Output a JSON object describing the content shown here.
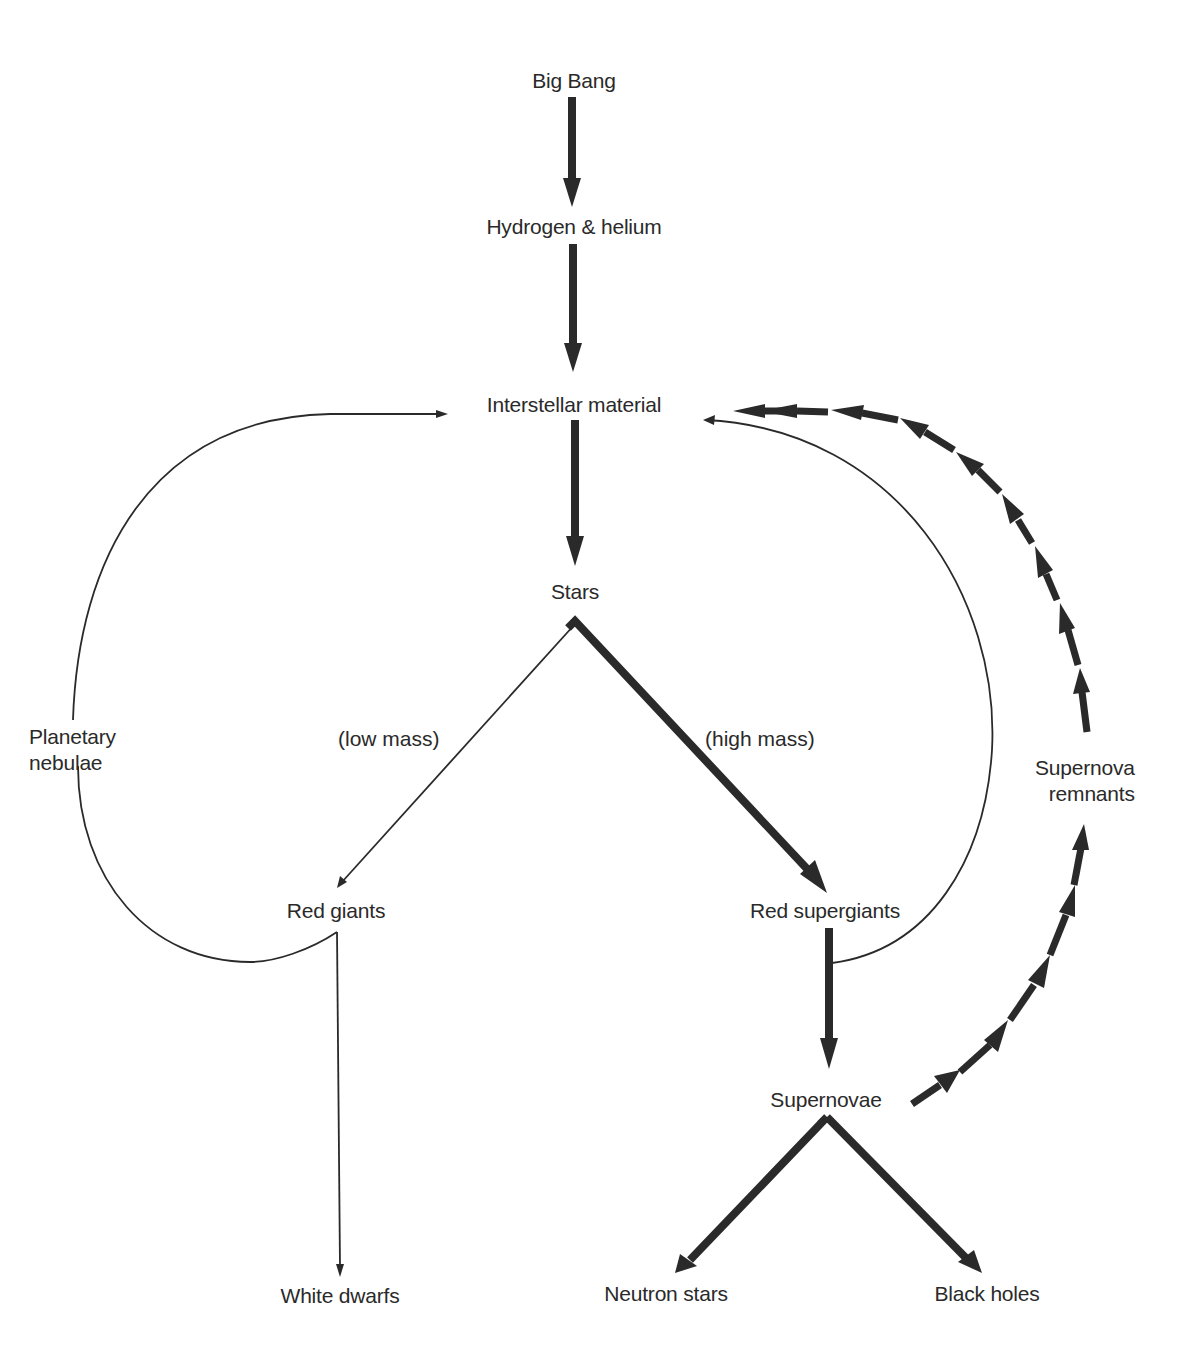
{
  "diagram": {
    "nodes": {
      "big_bang": "Big Bang",
      "hydrogen_helium": "Hydrogen & helium",
      "interstellar_material": "Interstellar material",
      "stars": "Stars",
      "planetary_nebulae": "Planetary\nnebulae",
      "red_giants": "Red giants",
      "red_supergiants": "Red supergiants",
      "supernova_remnants": "Supernova\nremnants",
      "supernovae": "Supernovae",
      "white_dwarfs": "White dwarfs",
      "neutron_stars": "Neutron stars",
      "black_holes": "Black holes"
    },
    "edge_labels": {
      "low_mass": "(low mass)",
      "high_mass": "(high mass)"
    },
    "edges": [
      {
        "from": "Big Bang",
        "to": "Hydrogen & helium",
        "style": "thick"
      },
      {
        "from": "Hydrogen & helium",
        "to": "Interstellar material",
        "style": "thick"
      },
      {
        "from": "Interstellar material",
        "to": "Stars",
        "style": "thick"
      },
      {
        "from": "Stars",
        "to": "Red giants",
        "style": "thin",
        "label": "(low mass)"
      },
      {
        "from": "Stars",
        "to": "Red supergiants",
        "style": "thick",
        "label": "(high mass)"
      },
      {
        "from": "Red giants",
        "to": "White dwarfs",
        "style": "thin"
      },
      {
        "from": "Red giants",
        "to": "Interstellar material",
        "style": "thin",
        "via": "Planetary nebulae"
      },
      {
        "from": "Red supergiants",
        "to": "Interstellar material",
        "style": "thin"
      },
      {
        "from": "Red supergiants",
        "to": "Supernovae",
        "style": "thick"
      },
      {
        "from": "Supernovae",
        "to": "Neutron stars",
        "style": "thick"
      },
      {
        "from": "Supernovae",
        "to": "Black holes",
        "style": "thick"
      },
      {
        "from": "Supernovae",
        "to": "Supernova remnants",
        "style": "dashed-thick"
      },
      {
        "from": "Supernova remnants",
        "to": "Interstellar material",
        "style": "dashed-thick"
      }
    ],
    "colors": {
      "ink": "#2a2a2a",
      "background": "#ffffff"
    }
  }
}
